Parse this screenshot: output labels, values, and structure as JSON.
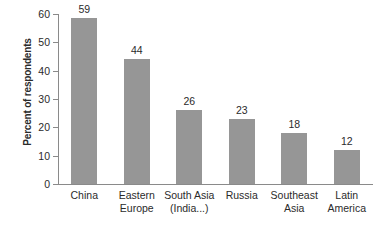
{
  "chart_data": {
    "type": "bar",
    "title": "",
    "subtitle": "",
    "xlabel": "",
    "ylabel": "Percent of respondents",
    "ylim": [
      0,
      60
    ],
    "yticks": [
      0,
      10,
      20,
      30,
      40,
      50,
      60
    ],
    "grid": false,
    "legend": null,
    "bar_color": "#969696",
    "axis_color": "#8a8a8a",
    "text_color": "#2b2b2b",
    "background": "#ffffff",
    "categories": [
      "China",
      "Eastern Europe",
      "South Asia (India...)",
      "Russia",
      "Southeast Asia",
      "Latin America"
    ],
    "category_lines": [
      [
        "China"
      ],
      [
        "Eastern",
        "Europe"
      ],
      [
        "South Asia",
        "(India...)"
      ],
      [
        "Russia"
      ],
      [
        "Southeast",
        "Asia"
      ],
      [
        "Latin",
        "America"
      ]
    ],
    "values": [
      59,
      44,
      26,
      23,
      18,
      12
    ],
    "value_labels": [
      "59",
      "44",
      "26",
      "23",
      "18",
      "12"
    ],
    "ytick_labels": [
      "0",
      "10",
      "20",
      "30",
      "40",
      "50",
      "60"
    ]
  }
}
